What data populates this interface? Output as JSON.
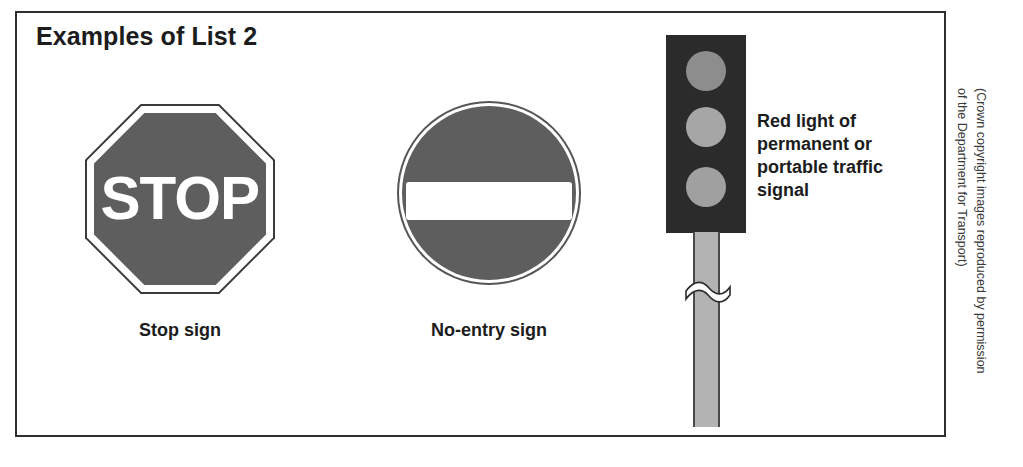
{
  "page": {
    "title": "Examples of List 2",
    "background_color": "#ffffff",
    "frame_color": "#2e2e2e"
  },
  "signs": [
    {
      "id": "stop-sign",
      "shape": "octagon",
      "word": "STOP",
      "caption": "Stop sign",
      "face_color": "#5e5e5e",
      "text_color": "#ffffff",
      "border_color": "#3b3b3b"
    },
    {
      "id": "no-entry-sign",
      "shape": "circle",
      "word": "",
      "caption": "No-entry sign",
      "face_color": "#5e5e5e",
      "bar_color": "#ffffff",
      "border_color": "#555555"
    }
  ],
  "traffic_signal": {
    "id": "traffic-signal",
    "housing_color": "#2b2b2b",
    "pole_color": "#b3b3b3",
    "lamps": [
      {
        "name": "red-lamp",
        "color": "#8d8d8d"
      },
      {
        "name": "amber-lamp",
        "color": "#a6a6a6"
      },
      {
        "name": "green-lamp",
        "color": "#a0a0a0"
      }
    ],
    "caption_lines": [
      "Red light of",
      "permanent or",
      "portable traffic",
      "signal"
    ]
  },
  "credit": {
    "line1": "(Crown copyright images reproduced by permission",
    "line2": "of the Department for Transport)"
  }
}
